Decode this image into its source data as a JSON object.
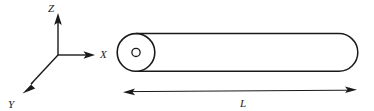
{
  "figure": {
    "background_color": "#ffffff",
    "line_color": "#1a1a1a",
    "label_color": "#1a1a1a"
  },
  "axes": {
    "origin": {
      "x": 58,
      "y": 55
    },
    "items": [
      {
        "name": "z-axis",
        "label": "Z",
        "direction": "up",
        "label_x": 48,
        "label_y": 12,
        "line": {
          "x1": 58,
          "y1": 55,
          "x2": 58,
          "y2": 20
        },
        "arrow_tip": {
          "x": 58,
          "y": 14
        }
      },
      {
        "name": "x-axis",
        "label": "X",
        "direction": "right",
        "label_x": 100,
        "label_y": 56,
        "line": {
          "x1": 58,
          "y1": 55,
          "x2": 88,
          "y2": 55
        },
        "arrow_tip": {
          "x": 95,
          "y": 55
        }
      },
      {
        "name": "y-axis",
        "label": "Y",
        "direction": "down-left",
        "label_x": 10,
        "label_y": 107,
        "line": {
          "x1": 58,
          "y1": 55,
          "x2": 30,
          "y2": 85
        },
        "arrow_tip": {
          "x": 23,
          "y": 93
        }
      }
    ]
  },
  "cylinder": {
    "name": "rod",
    "end_cap_center": {
      "x": 136,
      "y": 52
    },
    "end_cap_radius": 19,
    "hub_radius": 4,
    "body_top_y": 34,
    "body_bottom_y": 71,
    "body_left_x": 136,
    "body_right_x": 339,
    "right_cap_radius": 19
  },
  "dimension": {
    "name": "length-dimension",
    "label": "L",
    "label_x": 243,
    "label_y": 106,
    "line": {
      "x1": 124,
      "y1": 92,
      "x2": 356,
      "y2": 90
    },
    "double_headed": true
  }
}
